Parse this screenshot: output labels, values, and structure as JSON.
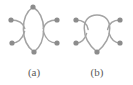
{
  "figure": {
    "background_color": "#ffffff",
    "node_color": "#8c8c8c",
    "edge_color": "#a3a3a3",
    "caption_color": "#5a5a5a",
    "width": 133,
    "height": 85
  },
  "panels": [
    {
      "id": "a",
      "caption": "(a)",
      "caption_x": 34,
      "caption_y": 76,
      "description": "lens / theta graph with two curved edges between a top and bottom vertex, plus four pendant vertices",
      "nodes": [
        {
          "name": "top-vertex",
          "x": 33,
          "y": 7,
          "r": 2.6
        },
        {
          "name": "bottom-vertex",
          "x": 34,
          "y": 52,
          "r": 2.6
        },
        {
          "name": "pendant-upper-left",
          "x": 11,
          "y": 20,
          "r": 2.6
        },
        {
          "name": "pendant-lower-left",
          "x": 12,
          "y": 43,
          "r": 2.6
        },
        {
          "name": "pendant-upper-right",
          "x": 57,
          "y": 20,
          "r": 2.6
        },
        {
          "name": "pendant-lower-right",
          "x": 57,
          "y": 43,
          "r": 2.6
        }
      ],
      "edges": [
        {
          "name": "edge-left-bow",
          "d": "M 33 7 C 20 16 20 42 34 52"
        },
        {
          "name": "edge-right-bow",
          "d": "M 33 7 C 47 16 47 42 34 52"
        }
      ],
      "stubs": [
        {
          "name": "stub-upper-left",
          "d": "M 11 20 C 18 20 23 22 24.8 28.5"
        },
        {
          "name": "stub-lower-left",
          "d": "M 12 43 C 18 43 22 40 24.6 31.5"
        },
        {
          "name": "stub-upper-right",
          "d": "M 57 20 C 50 20 45 22 43.2 28.5"
        },
        {
          "name": "stub-lower-right",
          "d": "M 57 43 C 50 43 46 40 43.4 31.5"
        }
      ]
    },
    {
      "id": "b",
      "caption": "(b)",
      "caption_x": 97,
      "caption_y": 76,
      "description": "teardrop / loop graph: a single bottom vertex with a self-loop arcing over the top, plus four pendant vertices",
      "nodes": [
        {
          "name": "bottom-vertex",
          "x": 97,
          "y": 52,
          "r": 2.6
        },
        {
          "name": "pendant-upper-left",
          "x": 76,
          "y": 20,
          "r": 2.6
        },
        {
          "name": "pendant-lower-left",
          "x": 76,
          "y": 43,
          "r": 2.6
        },
        {
          "name": "pendant-upper-right",
          "x": 120,
          "y": 20,
          "r": 2.6
        },
        {
          "name": "pendant-lower-right",
          "x": 120,
          "y": 43,
          "r": 2.6
        }
      ],
      "edges": [
        {
          "name": "edge-self-loop",
          "d": "M 97 52 C 80 38 80 15 97 15 C 114 15 114 38 97 52"
        }
      ],
      "stubs": [
        {
          "name": "stub-upper-left",
          "d": "M 76 20 C 83 20 87 23 88.2 29.5"
        },
        {
          "name": "stub-lower-left",
          "d": "M 76 43 C 82 43 85 39 86.6 33.5"
        },
        {
          "name": "stub-upper-right",
          "d": "M 120 20 C 113 20 109 23 107.6 29.5"
        },
        {
          "name": "stub-lower-right",
          "d": "M 120 43 C 114 43 111 39 109.2 33.5"
        }
      ]
    }
  ]
}
